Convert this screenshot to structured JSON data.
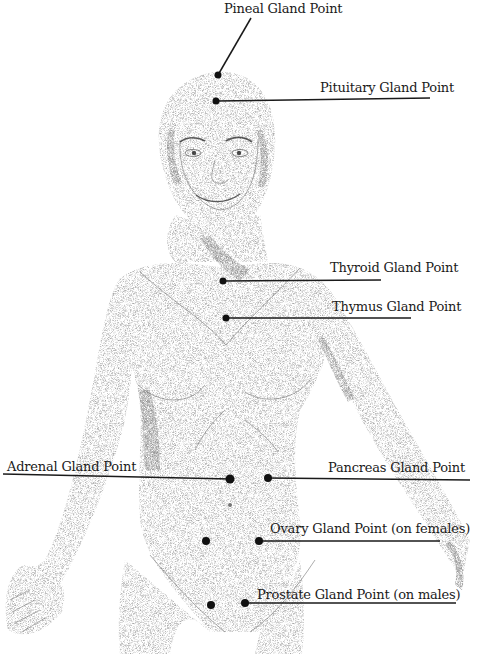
{
  "diagram": {
    "colors": {
      "ink": "#1a1a1a",
      "stipple": "#6b6b6b",
      "background": "#ffffff"
    },
    "labels": [
      {
        "id": "pineal",
        "text": "Pineal Gland Point",
        "x": 224,
        "y": 1
      },
      {
        "id": "pituitary",
        "text": "Pituitary Gland Point",
        "x": 320,
        "y": 80
      },
      {
        "id": "thyroid",
        "text": "Thyroid Gland Point",
        "x": 330,
        "y": 260
      },
      {
        "id": "thymus",
        "text": "Thymus Gland Point",
        "x": 332,
        "y": 299
      },
      {
        "id": "adrenal",
        "text": "Adrenal Gland Point",
        "x": 7,
        "y": 459
      },
      {
        "id": "pancreas",
        "text": "Pancreas Gland Point",
        "x": 328,
        "y": 460
      },
      {
        "id": "ovary",
        "text": "Ovary Gland Point (on females)",
        "x": 270,
        "y": 521
      },
      {
        "id": "prostate",
        "text": "Prostate Gland Point (on males)",
        "x": 257,
        "y": 587
      }
    ],
    "points": [
      {
        "id": "pineal",
        "cx": 218,
        "cy": 75,
        "r": 3.5
      },
      {
        "id": "pituitary",
        "cx": 216,
        "cy": 101,
        "r": 3.5
      },
      {
        "id": "thyroid",
        "cx": 223,
        "cy": 281,
        "r": 3.5
      },
      {
        "id": "thymus",
        "cx": 226,
        "cy": 318,
        "r": 3.5
      },
      {
        "id": "adrenal",
        "cx": 230,
        "cy": 479,
        "r": 4.5
      },
      {
        "id": "pancreas",
        "cx": 268,
        "cy": 478,
        "r": 4
      },
      {
        "id": "ovary-left",
        "cx": 206,
        "cy": 541,
        "r": 4
      },
      {
        "id": "ovary-right",
        "cx": 259,
        "cy": 541,
        "r": 4
      },
      {
        "id": "prostate-left",
        "cx": 211,
        "cy": 605,
        "r": 4
      },
      {
        "id": "prostate-right",
        "cx": 245,
        "cy": 603,
        "r": 4
      }
    ],
    "leaders": [
      {
        "id": "pineal",
        "x1": 218,
        "y1": 75,
        "x2": 251,
        "y2": 18
      },
      {
        "id": "pituitary",
        "x1": 216,
        "y1": 101,
        "x2": 430,
        "y2": 98
      },
      {
        "id": "thyroid",
        "x1": 223,
        "y1": 281,
        "x2": 381,
        "y2": 280
      },
      {
        "id": "thymus",
        "x1": 226,
        "y1": 318,
        "x2": 411,
        "y2": 318
      },
      {
        "id": "adrenal",
        "x1": 3,
        "y1": 474,
        "x2": 230,
        "y2": 479
      },
      {
        "id": "pancreas",
        "x1": 268,
        "y1": 478,
        "x2": 470,
        "y2": 480
      },
      {
        "id": "ovary",
        "x1": 259,
        "y1": 541,
        "x2": 440,
        "y2": 541
      },
      {
        "id": "prostate",
        "x1": 245,
        "y1": 603,
        "x2": 456,
        "y2": 603
      }
    ]
  }
}
